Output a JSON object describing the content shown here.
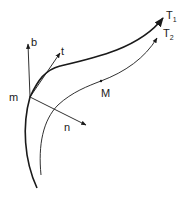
{
  "diagram": {
    "type": "curves-with-frame",
    "colors": {
      "ink": "#1a1a1a",
      "background": "#ffffff"
    },
    "point_m": {
      "label": "m"
    },
    "point_M": {
      "label": "M"
    },
    "vectors": [
      {
        "id": "b",
        "label": "b"
      },
      {
        "id": "t",
        "label": "t"
      },
      {
        "id": "n",
        "label": "n"
      }
    ],
    "curves": [
      {
        "id": "T1",
        "label": "T",
        "subscript": "1"
      },
      {
        "id": "T2",
        "label": "T",
        "subscript": "2"
      }
    ]
  }
}
